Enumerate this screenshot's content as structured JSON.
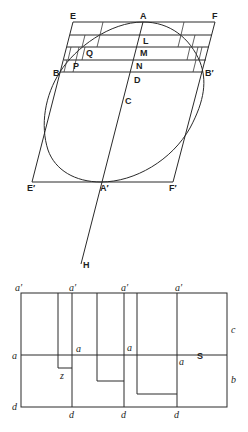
{
  "figure_top": {
    "description": "Ellipse inscribed in parallelogram with conjugate diameters and inscribed step-rectangles",
    "labels": {
      "E": "E",
      "A": "A",
      "F": "F",
      "L": "L",
      "Q": "Q",
      "M": "M",
      "P": "P",
      "N": "N",
      "B": "B",
      "D": "D",
      "B_prime": "B′",
      "C": "C",
      "E_prime": "E′",
      "A_prime": "A′",
      "F_prime": "F′",
      "H": "H"
    }
  },
  "figure_bottom": {
    "description": "Rectangle divided by vertical lines a′–d with step areas below line a–a",
    "labels": {
      "a_prime_1": "a′",
      "a_prime_2": "a′",
      "a_prime_3": "a′",
      "a_prime_4": "a′",
      "a_1": "a",
      "a_2": "a",
      "a_3": "a",
      "a_4": "a",
      "S": "S",
      "c": "c",
      "b": "b",
      "z": "z",
      "d_1": "d",
      "d_2": "d",
      "d_3": "d",
      "d_4": "d"
    }
  },
  "colors": {
    "ink": "#2a2a2a",
    "background": "#ffffff"
  }
}
